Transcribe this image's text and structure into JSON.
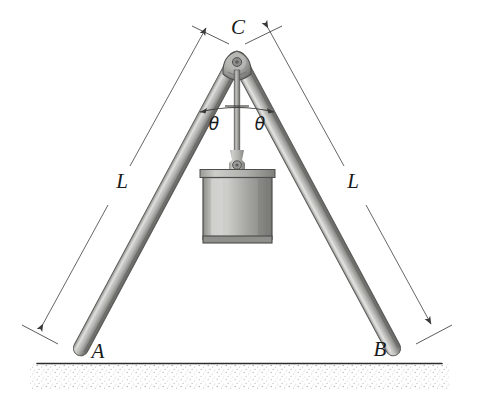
{
  "figure": {
    "labels": {
      "apex": "C",
      "left_base": "A",
      "right_base": "B",
      "left_length": "L",
      "right_length": "L",
      "left_angle": "θ",
      "right_angle": "θ"
    },
    "colors": {
      "ink": "#1a1a1a",
      "line": "#4a4a4a",
      "pole_light": "#d8d8d6",
      "pole_mid": "#a9a9a6",
      "pole_dark": "#6f6f6d",
      "weight_light": "#cfcfcd",
      "weight_mid": "#a2a2a0",
      "weight_dark": "#6a6a68",
      "joint": "#909090",
      "ground": "#333333",
      "stipple": "#b9b9b7",
      "background": "#ffffff"
    },
    "geometry": {
      "apex": {
        "x": 237,
        "y": 57
      },
      "left_base": {
        "x": 72,
        "y": 358
      },
      "right_base": {
        "x": 404,
        "y": 358
      },
      "ground_line": {
        "x1": 37,
        "y1": 363,
        "x2": 442,
        "y2": 363
      },
      "weight_box": {
        "x": 203,
        "y": 170,
        "width": 69,
        "height": 73
      },
      "rope": {
        "x": 237,
        "y_top": 70,
        "y_bottom": 170
      },
      "angle_arc_radius": 42
    }
  }
}
